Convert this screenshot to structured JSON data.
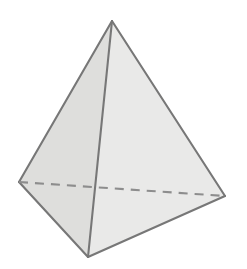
{
  "figure": {
    "name": "square-pyramid",
    "title": "Square pyramid (tetrahedron-style line drawing)",
    "background_color": "#ffffff",
    "canvas": {
      "width": 247,
      "height": 269
    },
    "edge_color": "#777777",
    "hidden_edge_color": "#8d8d8d",
    "edge_width": 2.1,
    "hidden_edge_width": 2.1,
    "hidden_edge_dash": "9 7",
    "vertices": {
      "apex": {
        "label": "apex",
        "x": 112,
        "y": 21
      },
      "left": {
        "label": "left-base-corner",
        "x": 19,
        "y": 182
      },
      "right": {
        "label": "right-base-corner",
        "x": 225,
        "y": 196
      },
      "front": {
        "label": "front-base-corner",
        "x": 88,
        "y": 257
      }
    },
    "faces": [
      {
        "name": "left-face",
        "fill": "#dededc",
        "points": "112,21 19,182 88,257"
      },
      {
        "name": "right-face",
        "fill": "#e9e9e8",
        "points": "112,21 225,196 88,257"
      },
      {
        "name": "lower-left-base-face",
        "fill": "#e3e3e1",
        "points": "19,182 88,257 112,21"
      }
    ],
    "visible_edges": [
      {
        "name": "apex-to-left-edge",
        "d": "M 112 21 L 19 182"
      },
      {
        "name": "apex-to-right-edge",
        "d": "M 112 21 L 225 196"
      },
      {
        "name": "apex-to-front-edge",
        "d": "M 112 21 L 88 257"
      },
      {
        "name": "left-to-front-edge",
        "d": "M 19 182 L 88 257"
      },
      {
        "name": "front-to-right-edge",
        "d": "M 88 257 L 225 196"
      }
    ],
    "hidden_edges": [
      {
        "name": "left-to-right-hidden-edge",
        "d": "M 19 182 L 225 196"
      }
    ]
  }
}
